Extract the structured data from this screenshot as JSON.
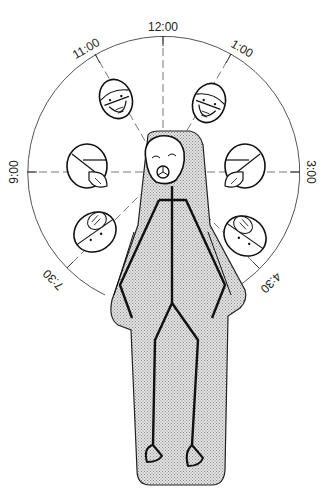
{
  "diagram": {
    "type": "surgical-team-positions-clock-diagram",
    "center": {
      "x": 163,
      "y": 172
    },
    "radius": 136,
    "clock_labels": [
      {
        "id": "12",
        "text": "12:00",
        "angle_deg": 0
      },
      {
        "id": "1",
        "text": "1:00",
        "angle_deg": 30
      },
      {
        "id": "3",
        "text": "3:00",
        "angle_deg": 90
      },
      {
        "id": "4_30",
        "text": "4:30",
        "angle_deg": 135
      },
      {
        "id": "7_30",
        "text": "7:30",
        "angle_deg": 225
      },
      {
        "id": "9",
        "text": "9:00",
        "angle_deg": 270
      },
      {
        "id": "11",
        "text": "11:00",
        "angle_deg": 330
      }
    ],
    "surgeon_heads": [
      {
        "position": "11:00",
        "view": "front-facing, masked with goggles"
      },
      {
        "position": "1:00",
        "view": "front-facing, masked with goggles"
      },
      {
        "position": "9:00",
        "view": "side profile, masked"
      },
      {
        "position": "3:00",
        "view": "side profile, masked"
      },
      {
        "position": "7:30",
        "view": "top-down, masked"
      },
      {
        "position": "4:30",
        "view": "top-down, masked"
      }
    ],
    "patient": {
      "description": "supine stick figure on shaded operating table, head at center"
    },
    "colors": {
      "line": "#111111",
      "circle": "#555555",
      "shade": "#bdbdbd",
      "background": "#ffffff"
    }
  }
}
